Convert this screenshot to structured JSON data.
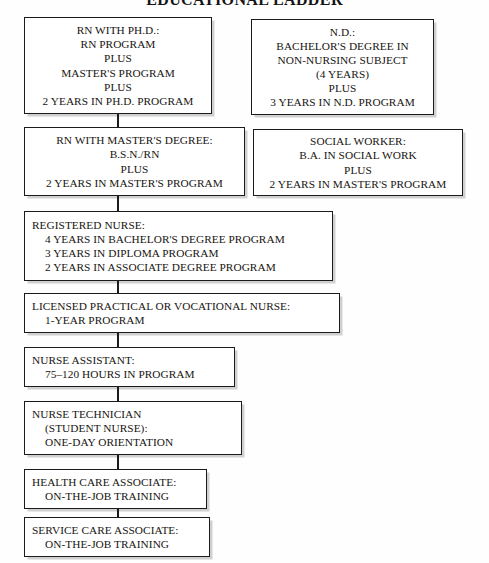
{
  "title": "EDUCATIONAL LADDER",
  "theme": {
    "page_background": "#fefefe",
    "box_background": "#ffffff",
    "border_color": "#1b1b1b",
    "text_color": "#17140f",
    "shadow_color": "#8c8c8c"
  },
  "boxes": {
    "rn_phd": {
      "name": "rn-with-phd",
      "align": "center",
      "lines": [
        "RN WITH PH.D.:",
        "RN PROGRAM",
        "PLUS",
        "MASTER'S PROGRAM",
        "PLUS",
        "2 YEARS IN PH.D. PROGRAM"
      ]
    },
    "nd": {
      "name": "nd-doctor-of-nursing",
      "align": "center",
      "lines": [
        "N.D.:",
        "BACHELOR'S DEGREE IN",
        "NON-NURSING SUBJECT",
        "(4 YEARS)",
        "PLUS",
        "3 YEARS IN N.D. PROGRAM"
      ]
    },
    "rn_masters": {
      "name": "rn-with-masters-degree",
      "align": "center",
      "lines": [
        "RN WITH MASTER'S DEGREE:",
        "B.S.N./RN",
        "PLUS",
        "2 YEARS IN MASTER'S PROGRAM"
      ]
    },
    "social_worker": {
      "name": "social-worker",
      "align": "center",
      "lines": [
        "SOCIAL WORKER:",
        "B.A. IN SOCIAL WORK",
        "PLUS",
        "2 YEARS IN MASTER'S PROGRAM"
      ]
    },
    "registered_nurse": {
      "name": "registered-nurse",
      "align": "left",
      "lines": [
        "REGISTERED NURSE:",
        "4 YEARS IN BACHELOR'S DEGREE PROGRAM",
        "3 YEARS IN DIPLOMA PROGRAM",
        "2 YEARS IN ASSOCIATE DEGREE PROGRAM"
      ],
      "indented": [
        false,
        true,
        true,
        true
      ]
    },
    "lpn": {
      "name": "licensed-practical-or-vocational-nurse",
      "align": "left",
      "lines": [
        "LICENSED PRACTICAL OR VOCATIONAL NURSE:",
        "1-YEAR PROGRAM"
      ],
      "indented": [
        false,
        true
      ]
    },
    "nurse_assistant": {
      "name": "nurse-assistant",
      "align": "left",
      "lines": [
        "NURSE ASSISTANT:",
        "75–120 HOURS IN PROGRAM"
      ],
      "indented": [
        false,
        true
      ]
    },
    "nurse_technician": {
      "name": "nurse-technician",
      "align": "left",
      "lines": [
        "NURSE TECHNICIAN",
        "(STUDENT NURSE):",
        "ONE-DAY ORIENTATION"
      ],
      "indented": [
        false,
        true,
        true
      ]
    },
    "health_care_associate": {
      "name": "health-care-associate",
      "align": "left",
      "lines": [
        "HEALTH CARE ASSOCIATE:",
        "ON-THE-JOB TRAINING"
      ],
      "indented": [
        false,
        true
      ]
    },
    "service_care_associate": {
      "name": "service-care-associate",
      "align": "left",
      "lines": [
        "SERVICE CARE ASSOCIATE:",
        "ON-THE-JOB TRAINING"
      ],
      "indented": [
        false,
        true
      ]
    }
  },
  "connector_count": 8
}
